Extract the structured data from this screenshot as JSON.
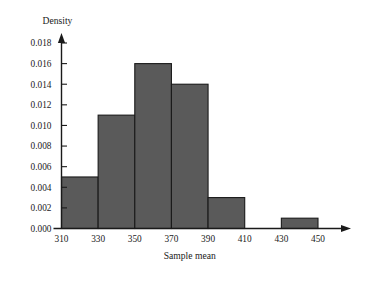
{
  "chart_data": {
    "type": "bar",
    "title": "",
    "subtitle": "",
    "xlabel": "Sample mean",
    "ylabel": "Density",
    "categories": [
      "310-330",
      "330-350",
      "350-370",
      "370-390",
      "390-410",
      "410-430",
      "430-450"
    ],
    "bin_edges": [
      310,
      330,
      350,
      370,
      390,
      410,
      430,
      450
    ],
    "values": [
      0.005,
      0.011,
      0.016,
      0.014,
      0.003,
      0.0,
      0.001
    ],
    "bar_color": "#5a5a5a",
    "bar_edge_color": "#1a1a1a",
    "xlim": [
      310,
      450
    ],
    "ylim": [
      0.0,
      0.018
    ],
    "x_ticks": [
      310,
      330,
      350,
      370,
      390,
      410,
      430,
      450
    ],
    "x_tick_labels": [
      "310",
      "330",
      "350",
      "370",
      "390",
      "410",
      "430",
      "450"
    ],
    "y_ticks": [
      0.0,
      0.002,
      0.004,
      0.006,
      0.008,
      0.01,
      0.012,
      0.014,
      0.016,
      0.018
    ],
    "y_tick_labels": [
      "0.000",
      "0.002",
      "0.004",
      "0.006",
      "0.008",
      "0.010",
      "0.012",
      "0.014",
      "0.016",
      "0.018"
    ],
    "grid": false,
    "legend": null,
    "annotations": [],
    "axis_arrows": {
      "x": "right",
      "y": "up"
    }
  }
}
